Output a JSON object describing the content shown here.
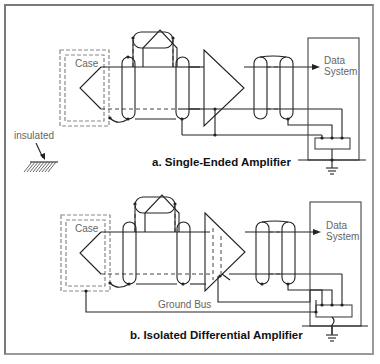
{
  "figure": {
    "panels": [
      {
        "id": "a",
        "caption": "a.  Single-Ended Amplifier",
        "case_label": "Case",
        "data_system_line1": "Data",
        "data_system_line2": "System",
        "amplifier_type": "single-ended"
      },
      {
        "id": "b",
        "caption": "b.  Isolated Differential Amplifier",
        "case_label": "Case",
        "data_system_line1": "Data",
        "data_system_line2": "System",
        "ground_bus_label": "Ground Bus",
        "amplifier_type": "isolated-differential"
      }
    ],
    "legend": {
      "insulated_label": "insulated"
    }
  },
  "colors": {
    "line": "#222222",
    "case_dash": "#888888",
    "frame": "#7a7a7a",
    "label_text": "#666666",
    "caption_text": "#111111"
  }
}
